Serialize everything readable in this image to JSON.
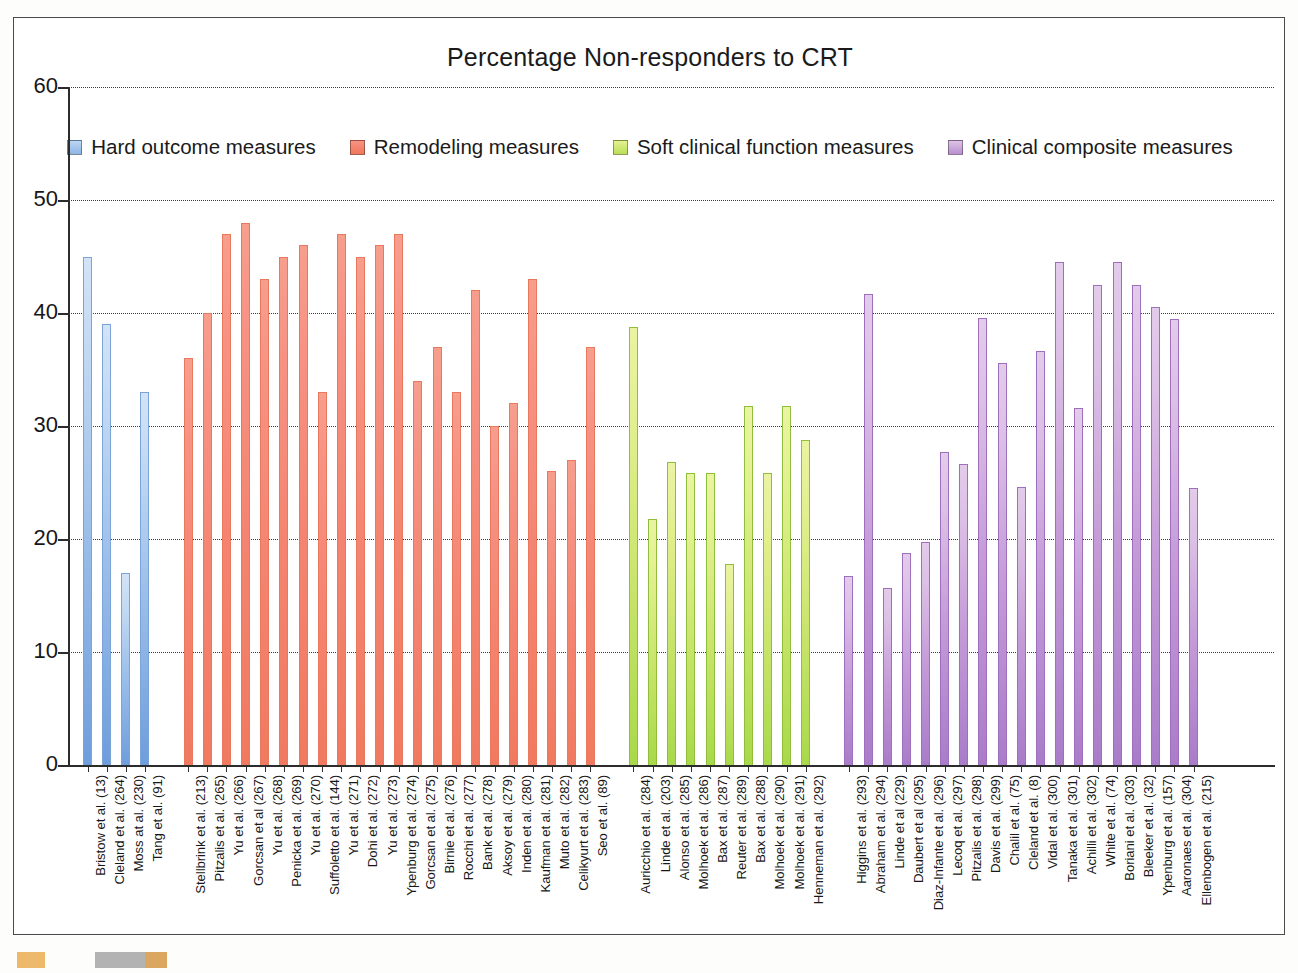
{
  "chart_data": {
    "type": "bar",
    "title": "Percentage Non-responders to CRT",
    "xlabel": "",
    "ylabel": "",
    "ylim": [
      0,
      60
    ],
    "yticks": [
      0,
      10,
      20,
      30,
      40,
      50,
      60
    ],
    "grid": true,
    "legend_position": "top-center",
    "series": [
      {
        "name": "Hard outcome measures",
        "color": "#8fb5e4",
        "categories": [
          "Bristow et al. (13)",
          "Cleland et al. (264)",
          "Moss at al. (230)",
          "Tang et al. (91)"
        ],
        "values": [
          45.0,
          39.0,
          17.0,
          33.0
        ]
      },
      {
        "name": "Remodeling measures",
        "color": "#f0775c",
        "categories": [
          "Stellbrink et al. (213)",
          "Pitzalis et al. (265)",
          "Yu et al. (266)",
          "Gorcsan et al (267)",
          "Yu et al. (268)",
          "Penicka et al. (269)",
          "Yu et al. (270)",
          "Suffoletto et al. (144)",
          "Yu et al. (271)",
          "Dohi et al. (272)",
          "Yu et al. (273)",
          "Ypenburg et al. (274)",
          "Gorcsan et al. (275)",
          "Birnie et al. (276)",
          "Rocchi et al. (277)",
          "Bank et al. (278)",
          "Aksoy et al. (279)",
          "Inden et al. (280)",
          "Kaufman et al. (281)",
          "Muto et al. (282)",
          "Celikyurt et al. (283)",
          "Seo et al. (89)"
        ],
        "values": [
          36.0,
          40.0,
          47.0,
          48.0,
          43.0,
          45.0,
          46.0,
          33.0,
          47.0,
          45.0,
          46.0,
          47.0,
          34.0,
          37.0,
          33.0,
          42.0,
          30.0,
          32.0,
          43.0,
          26.0,
          27.0,
          37.0
        ]
      },
      {
        "name": "Soft clinical function measures",
        "color": "#b9de55",
        "categories": [
          "Auricchio et al. (284)",
          "Linde et al. (203)",
          "Alonso et al. (285)",
          "Molhoek et al. (286)",
          "Bax et al. (287)",
          "Reuter et al. (289)",
          "Bax et al. (288)",
          "Molhoek et al. (290)",
          "Molhoek et al. (291)",
          "Henneman et al. (292)"
        ],
        "values": [
          38.8,
          21.8,
          26.8,
          25.8,
          25.8,
          17.8,
          31.8,
          25.8,
          31.8,
          28.8
        ]
      },
      {
        "name": "Clinical composite measures",
        "color": "#b98fd0",
        "categories": [
          "Higgins et al. (293)",
          "Abraham et al. (294)",
          "Linde et al (229)",
          "Daubert et al (295)",
          "Diaz-Infante et al. (296)",
          "Lecoq et al. (297)",
          "Pitzalis et al. (298)",
          "Davis et al. (299)",
          "Chalil et al. (75)",
          "Cleland et al. (8)",
          "Vidal et al. (300)",
          "Tanaka et al. (301)",
          "Achilli et al. (302)",
          "White et al. (74)",
          "Boriani et al. (303)",
          "Bleeker et al. (32)",
          "Ypenburg et al. (157)",
          "Aaronaes et al. (304)",
          "Ellenbogen et al. (215)"
        ],
        "values": [
          16.7,
          41.7,
          15.7,
          18.8,
          19.7,
          27.7,
          26.6,
          39.6,
          35.6,
          24.6,
          36.6,
          44.5,
          31.6,
          42.5,
          44.5,
          42.5,
          40.5,
          39.5,
          24.5
        ]
      }
    ]
  }
}
